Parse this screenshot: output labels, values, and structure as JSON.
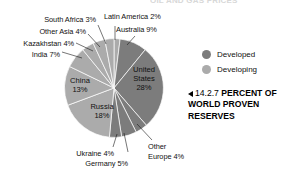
{
  "top_partial_header": "OIL AND GAS PRICES",
  "caption": {
    "marker": "left-triangle",
    "figure_number": "14.2.7",
    "text": "PERCENT OF WORLD PROVEN RESERVES"
  },
  "legend": {
    "position": "right",
    "items": [
      {
        "label": "Developed",
        "color": "#7c7c7c"
      },
      {
        "label": "Developing",
        "color": "#ababab"
      }
    ]
  },
  "chart_data": {
    "type": "pie",
    "title": "14.2.7 PERCENT OF WORLD PROVEN RESERVES",
    "units": "percent",
    "start_angle_deg": 0,
    "direction": "clockwise",
    "legend": [
      "Developed",
      "Developing"
    ],
    "categories": [
      "Latin America",
      "Australia",
      "United States",
      "Other Europe",
      "Germany",
      "Ukraine",
      "Russia",
      "China",
      "India",
      "Kazakhstan",
      "Other Asia",
      "South Africa"
    ],
    "values": [
      2,
      9,
      28,
      4,
      5,
      4,
      18,
      13,
      7,
      4,
      4,
      3
    ],
    "slices": [
      {
        "label": "Latin America",
        "value": 2,
        "display": "Latin America 2%",
        "group": "Developing",
        "color": "#ababab",
        "label_placement": "outside"
      },
      {
        "label": "Australia",
        "value": 9,
        "display": "Australia 9%",
        "group": "Developed",
        "color": "#7c7c7c",
        "label_placement": "outside"
      },
      {
        "label": "United States",
        "value": 28,
        "display": "United States 28%",
        "group": "Developed",
        "color": "#7c7c7c",
        "label_placement": "inside"
      },
      {
        "label": "Other Europe",
        "value": 4,
        "display": "Other Europe 4%",
        "group": "Developed",
        "color": "#7c7c7c",
        "label_placement": "outside"
      },
      {
        "label": "Germany",
        "value": 5,
        "display": "Germany 5%",
        "group": "Developed",
        "color": "#7c7c7c",
        "label_placement": "outside"
      },
      {
        "label": "Ukraine",
        "value": 4,
        "display": "Ukraine 4%",
        "group": "Developed",
        "color": "#7c7c7c",
        "label_placement": "outside"
      },
      {
        "label": "Russia",
        "value": 18,
        "display": "Russia 18%",
        "group": "Developing",
        "color": "#ababab",
        "label_placement": "inside"
      },
      {
        "label": "China",
        "value": 13,
        "display": "China 13%",
        "group": "Developing",
        "color": "#ababab",
        "label_placement": "inside"
      },
      {
        "label": "India",
        "value": 7,
        "display": "India 7%",
        "group": "Developing",
        "color": "#ababab",
        "label_placement": "outside"
      },
      {
        "label": "Kazakhstan",
        "value": 4,
        "display": "Kazakhstan 4%",
        "group": "Developing",
        "color": "#ababab",
        "label_placement": "outside"
      },
      {
        "label": "Other Asia",
        "value": 4,
        "display": "Other Asia 4%",
        "group": "Developing",
        "color": "#ababab",
        "label_placement": "outside"
      },
      {
        "label": "South Africa",
        "value": 3,
        "display": "South Africa 3%",
        "group": "Developing",
        "color": "#ababab",
        "label_placement": "outside"
      }
    ]
  },
  "labels": {
    "south_africa": "South Africa 3%",
    "other_asia": "Other Asia 4%",
    "kazakhstan": "Kazakhstan 4%",
    "india": "India 7%",
    "latin_america": "Latin America 2%",
    "australia": "Australia 9%",
    "united_states_line1": "United",
    "united_states_line2": "States",
    "united_states_line3": "28%",
    "china_line1": "China",
    "china_line2": "13%",
    "russia_line1": "Russia",
    "russia_line2": "18%",
    "ukraine": "Ukraine 4%",
    "germany": "Germany 5%",
    "other_europe_line1": "Other",
    "other_europe_line2": "Europe 4%"
  }
}
